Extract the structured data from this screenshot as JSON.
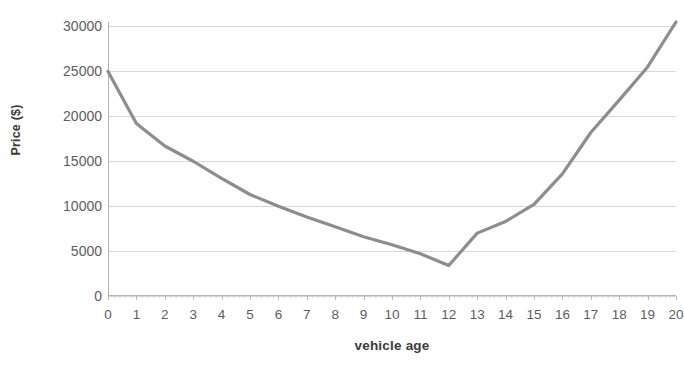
{
  "chart_data": {
    "type": "line",
    "title": "",
    "xlabel": "vehicle age",
    "ylabel": "Price ($)",
    "x": [
      0,
      1,
      2,
      3,
      4,
      5,
      6,
      7,
      8,
      9,
      10,
      11,
      12,
      13,
      14,
      15,
      16,
      17,
      18,
      19,
      20
    ],
    "values": [
      25000,
      19200,
      16700,
      15000,
      13100,
      11300,
      10000,
      8800,
      7700,
      6600,
      5700,
      4700,
      3400,
      7000,
      8300,
      10200,
      13600,
      18200,
      21800,
      25500,
      30500
    ],
    "series": [
      {
        "name": "Price",
        "values": [
          25000,
          19200,
          16700,
          15000,
          13100,
          11300,
          10000,
          8800,
          7700,
          6600,
          5700,
          4700,
          3400,
          7000,
          8300,
          10200,
          13600,
          18200,
          21800,
          25500,
          30500
        ],
        "color": "#8d8d8d"
      }
    ],
    "xlim": [
      0,
      20
    ],
    "ylim": [
      0,
      30500
    ],
    "yticks": [
      0,
      5000,
      10000,
      15000,
      20000,
      25000,
      30000
    ],
    "ytick_labels": [
      "0",
      "5000",
      "10000",
      "15000",
      "20000",
      "25000",
      "30000"
    ],
    "xticks": [
      0,
      1,
      2,
      3,
      4,
      5,
      6,
      7,
      8,
      9,
      10,
      11,
      12,
      13,
      14,
      15,
      16,
      17,
      18,
      19,
      20
    ],
    "xtick_labels": [
      "0",
      "1",
      "2",
      "3",
      "4",
      "5",
      "6",
      "7",
      "8",
      "9",
      "10",
      "11",
      "12",
      "13",
      "14",
      "15",
      "16",
      "17",
      "18",
      "19",
      "20"
    ],
    "grid": "horizontal",
    "legend": "none",
    "minimum_point": {
      "x": 12,
      "y": 3400
    },
    "line_color": "#8d8d8d",
    "gridline_color": "#d7d7d7",
    "axis_color": "#b3b3b3",
    "tick_label_color": "#5d5d5d",
    "axis_title_color": "#3b3b3b"
  },
  "axes": {
    "y_title": "Price ($)",
    "x_title": "vehicle age"
  },
  "title_fragment": ""
}
